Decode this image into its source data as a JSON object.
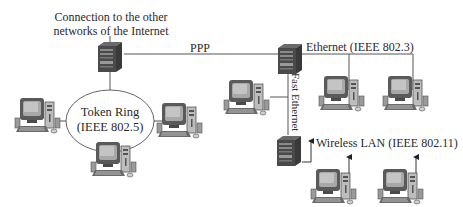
{
  "diagram": {
    "type": "network-topology",
    "labels": {
      "internet_connection_line1": "Connection to the other",
      "internet_connection_line2": "networks of the Internet",
      "ppp": "PPP",
      "ethernet": "Ethernet (IEEE 802.3)",
      "fast_ethernet": "Fast Ethernet",
      "token_ring_line1": "Token Ring",
      "token_ring_line2": "(IEEE 802.5)",
      "wireless": "Wireless LAN (IEEE 802.11)"
    },
    "nodes": [
      {
        "id": "router-internet",
        "kind": "server-tower",
        "icon": "server-icon"
      },
      {
        "id": "router-ethernet",
        "kind": "server-tower",
        "icon": "server-icon"
      },
      {
        "id": "router-wireless",
        "kind": "server-tower",
        "icon": "server-icon"
      },
      {
        "id": "tr-pc-left",
        "kind": "desktop-pc",
        "icon": "computer-icon",
        "network": "Token Ring"
      },
      {
        "id": "tr-pc-right",
        "kind": "desktop-pc",
        "icon": "computer-icon",
        "network": "Token Ring"
      },
      {
        "id": "tr-pc-bottom",
        "kind": "desktop-pc",
        "icon": "computer-icon",
        "network": "Token Ring"
      },
      {
        "id": "fe-pc",
        "kind": "desktop-pc",
        "icon": "computer-icon",
        "network": "Fast Ethernet"
      },
      {
        "id": "eth-pc-1",
        "kind": "desktop-pc",
        "icon": "computer-icon",
        "network": "Ethernet"
      },
      {
        "id": "eth-pc-2",
        "kind": "desktop-pc",
        "icon": "computer-icon",
        "network": "Ethernet"
      },
      {
        "id": "wl-pc-1",
        "kind": "desktop-pc",
        "icon": "computer-icon",
        "network": "Wireless LAN"
      },
      {
        "id": "wl-pc-2",
        "kind": "desktop-pc",
        "icon": "computer-icon",
        "network": "Wireless LAN"
      }
    ],
    "edges": [
      {
        "from": "router-internet",
        "to": "router-ethernet",
        "label": "PPP"
      },
      {
        "from": "router-internet",
        "to": "token-ring",
        "label": ""
      },
      {
        "from": "router-ethernet",
        "to": "eth-pc-1",
        "label": "Ethernet (IEEE 802.3)"
      },
      {
        "from": "router-ethernet",
        "to": "eth-pc-2",
        "label": "Ethernet (IEEE 802.3)"
      },
      {
        "from": "router-ethernet",
        "to": "router-wireless",
        "label": "Fast Ethernet"
      },
      {
        "from": "router-ethernet",
        "to": "fe-pc",
        "label": "Fast Ethernet"
      },
      {
        "from": "router-wireless",
        "to": "wl-pc-1",
        "label": "Wireless LAN (IEEE 802.11)"
      },
      {
        "from": "router-wireless",
        "to": "wl-pc-2",
        "label": "Wireless LAN (IEEE 802.11)"
      }
    ],
    "colors": {
      "line": "#555555",
      "ring": "#666666",
      "device_dark": "#2e2e2e",
      "device_mid": "#8a8a8a",
      "device_light": "#d0d0d0",
      "screen": "#9a9a9a"
    }
  }
}
